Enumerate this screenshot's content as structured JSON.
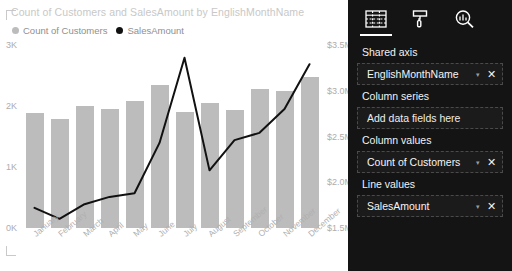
{
  "chart": {
    "title": "Count of Customers and SalesAmount by EnglishMonthName",
    "legend": [
      {
        "label": "Count of Customers",
        "color": "#bcbcbc",
        "marker": "circle"
      },
      {
        "label": "SalesAmount",
        "color": "#111111",
        "marker": "circle"
      }
    ]
  },
  "chart_data": {
    "type": "bar",
    "title": "Count of Customers and SalesAmount by EnglishMonthName",
    "xlabel": "EnglishMonthName",
    "ylabel": "Count of Customers",
    "y2label": "SalesAmount",
    "grid": false,
    "legend_position": "top-left",
    "categories": [
      "January",
      "February",
      "March",
      "April",
      "May",
      "June",
      "July",
      "August",
      "September",
      "October",
      "November",
      "December"
    ],
    "series": [
      {
        "name": "Count of Customers",
        "type": "bar",
        "axis": "left",
        "color": "#bcbcbc",
        "values": [
          1880,
          1790,
          2000,
          1950,
          2080,
          2350,
          1900,
          2050,
          1930,
          2280,
          2250,
          2480
        ]
      },
      {
        "name": "SalesAmount",
        "type": "line",
        "axis": "right",
        "color": "#111111",
        "values": [
          1720000,
          1600000,
          1760000,
          1840000,
          1880000,
          2430000,
          3360000,
          2130000,
          2460000,
          2540000,
          2800000,
          3290000
        ]
      }
    ],
    "yticks_left": [
      "0K",
      "1K",
      "2K",
      "3K"
    ],
    "ylim_left": [
      0,
      3000
    ],
    "yticks_right": [
      "$1.5M",
      "$2.0M",
      "$2.5M",
      "$3.0M",
      "$3.5M"
    ],
    "ylim_right": [
      1500000,
      3500000
    ]
  },
  "fields_pane": {
    "tabs": [
      {
        "name": "fields-tab",
        "icon": "fields-grid-icon",
        "active": true
      },
      {
        "name": "format-tab",
        "icon": "paint-roller-icon",
        "active": false
      },
      {
        "name": "analytics-tab",
        "icon": "analytics-magnifier-icon",
        "active": false
      }
    ],
    "wells": [
      {
        "label": "Shared axis",
        "field": "EnglishMonthName",
        "empty": false,
        "chevron": "▾",
        "remove": "✕"
      },
      {
        "label": "Column series",
        "field": "Add data fields here",
        "empty": true
      },
      {
        "label": "Column values",
        "field": "Count of Customers",
        "empty": false,
        "chevron": "▾",
        "remove": "✕"
      },
      {
        "label": "Line values",
        "field": "SalesAmount",
        "empty": false,
        "chevron": "▾",
        "remove": "✕"
      }
    ]
  }
}
